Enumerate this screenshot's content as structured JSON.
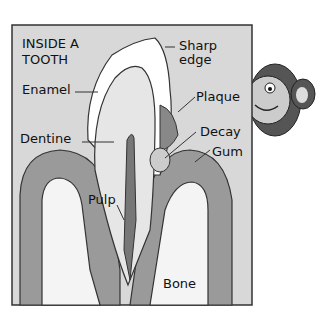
{
  "title_line1": "INSIDE A",
  "title_line2": "TOOTH",
  "labels": {
    "sharp_line1": "Sharp",
    "sharp_line2": "edge",
    "enamel": "Enamel",
    "plaque": "Plaque",
    "dentine": "Dentine",
    "decay": "Decay",
    "gum": "Gum",
    "pulp": "Pulp",
    "bone": "Bone"
  },
  "colors": {
    "background": "#d8d8d8",
    "gum": "#9a9a9a",
    "bone": "#f4f4f4",
    "enamel": "#ffffff",
    "dentine": "#e6e6e6",
    "pulp": "#777777",
    "outline": "#333333"
  }
}
